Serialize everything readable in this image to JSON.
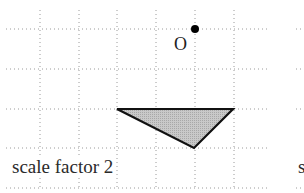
{
  "diagram": {
    "center_label": "O",
    "caption": "scale factor 2",
    "caption_next_panel": "s",
    "grid": {
      "vertical_x": [
        40,
        79,
        117,
        156,
        195,
        234
      ],
      "horizontal_y": [
        29,
        69,
        109,
        148,
        188
      ],
      "x_start": 6,
      "x_end": 268,
      "y_start": 10,
      "y_end": 190,
      "spacing": 39
    },
    "center_point": {
      "x": 195,
      "y": 29
    },
    "triangle": {
      "points": [
        [
          117,
          109
        ],
        [
          233,
          109
        ],
        [
          194,
          148
        ]
      ],
      "fill": "#c8c8c8",
      "stroke": "#111111"
    },
    "colors": {
      "grid": "#999999",
      "point": "#000000"
    }
  }
}
